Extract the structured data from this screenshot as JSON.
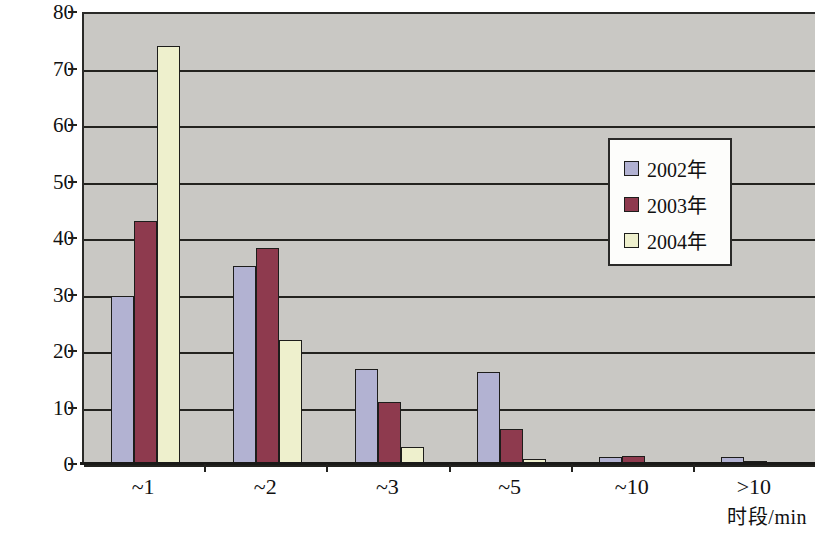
{
  "chart_data": {
    "type": "bar",
    "title": "",
    "xlabel": "时段/min",
    "ylabel": "构成比/%",
    "categories": [
      "~1",
      "~2",
      "~3",
      "~5",
      "~10",
      ">10"
    ],
    "series": [
      {
        "name": "2002年",
        "color": "#b2b2d2",
        "values": [
          29.8,
          35.0,
          16.8,
          16.2,
          1.2,
          1.2
        ]
      },
      {
        "name": "2003年",
        "color": "#8e3a4e",
        "values": [
          43.0,
          38.2,
          11.0,
          6.2,
          1.4,
          0.6
        ]
      },
      {
        "name": "2004年",
        "color": "#eef0cd",
        "values": [
          74.0,
          22.0,
          3.1,
          0.8,
          0.1,
          0.2
        ]
      }
    ],
    "ylim": [
      0,
      80
    ],
    "yticks": [
      0,
      10,
      20,
      30,
      40,
      50,
      60,
      70,
      80
    ],
    "ytick_labels": [
      "0",
      "10",
      "20",
      "30",
      "40",
      "50",
      "60",
      "70",
      "80"
    ],
    "grid": true,
    "grid_axis": "y",
    "legend_position": "upper-right",
    "plot_background": "#c9c8c4",
    "gridline_color": "#23231f",
    "axis_color": "#1a1a18"
  },
  "legend": {
    "entries": [
      {
        "label": "2002年"
      },
      {
        "label": "2003年"
      },
      {
        "label": "2004年"
      }
    ]
  }
}
